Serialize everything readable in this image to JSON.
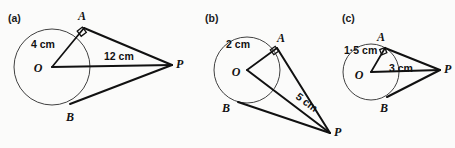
{
  "figure": {
    "background_color": "#fbfbfa",
    "ink_color": "#111111",
    "circle_stroke_color": "#2b2b2b"
  },
  "panels": [
    {
      "id": "a",
      "panel_label": "(a)",
      "radius_label": "4 cm",
      "distance_label": "12 cm",
      "points": {
        "center": "O",
        "tangent_upper": "A",
        "tangent_lower": "B",
        "external": "P"
      },
      "geometry": {
        "circle_cx": 52,
        "circle_cy": 67,
        "circle_r": 38,
        "A": [
          84,
          28
        ],
        "B": [
          70,
          104
        ],
        "P": [
          172,
          65
        ],
        "right_angle_at": "A"
      },
      "label_positions": {
        "panel_label": [
          8,
          22
        ],
        "O": [
          38,
          72
        ],
        "A": [
          82,
          20
        ],
        "B": [
          70,
          121
        ],
        "P": [
          176,
          68
        ],
        "radius_label": [
          31,
          48
        ],
        "distance_label": [
          104,
          60
        ]
      }
    },
    {
      "id": "b",
      "panel_label": "(b)",
      "radius_label": "2 cm",
      "distance_label": "5 cm",
      "points": {
        "center": "O",
        "tangent_upper": "A",
        "tangent_lower": "B",
        "external": "P"
      },
      "geometry": {
        "circle_cx": 247,
        "circle_cy": 70,
        "circle_r": 33,
        "A": [
          277,
          48
        ],
        "B": [
          238,
          102
        ],
        "P": [
          330,
          133
        ],
        "right_angle_at": "A"
      },
      "label_positions": {
        "panel_label": [
          205,
          22
        ],
        "O": [
          236,
          76
        ],
        "A": [
          281,
          42
        ],
        "B": [
          226,
          112
        ],
        "P": [
          334,
          136
        ],
        "radius_label": [
          238,
          48
        ],
        "distance_label": [
          295,
          98
        ]
      }
    },
    {
      "id": "c",
      "panel_label": "(c)",
      "radius_label": "1·5 cm",
      "distance_label": "3 cm",
      "points": {
        "center": "O",
        "tangent_upper": "A",
        "tangent_lower": "B",
        "external": "P"
      },
      "geometry": {
        "circle_cx": 371,
        "circle_cy": 72,
        "circle_r": 28,
        "A": [
          385,
          48
        ],
        "B": [
          387,
          97
        ],
        "P": [
          440,
          70
        ],
        "right_angle_at": "A"
      },
      "label_positions": {
        "panel_label": [
          342,
          22
        ],
        "O": [
          359,
          79
        ],
        "A": [
          381,
          41
        ],
        "B": [
          384,
          112
        ],
        "radius_label": [
          344,
          54
        ],
        "distance_label": [
          389,
          72
        ],
        "P": [
          444,
          73
        ]
      }
    }
  ]
}
